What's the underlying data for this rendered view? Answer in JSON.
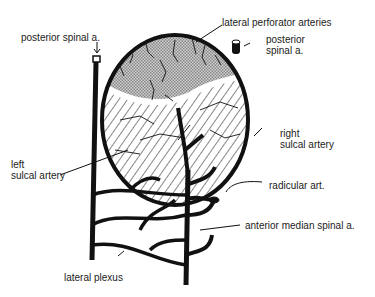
{
  "figure": {
    "colors": {
      "ink": "#111111",
      "gray_region": "#b3b3b3",
      "hatch": "#222222",
      "background": "#ffffff"
    }
  },
  "labels": {
    "lateral_perforator_arteries": "lateral perforator arteries",
    "posterior_spinal_left": "posterior spinal a.",
    "posterior_spinal_right_line1": "posterior",
    "posterior_spinal_right_line2": "spinal a.",
    "right_sulcal_line1": "right",
    "right_sulcal_line2": "sulcal artery",
    "left_sulcal_line1": "left",
    "left_sulcal_line2": "sulcal artery",
    "radicular": "radicular art.",
    "anterior_median_spinal": "anterior median spinal a.",
    "lateral_plexus": "lateral plexus"
  }
}
